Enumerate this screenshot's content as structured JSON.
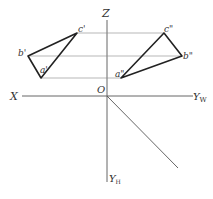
{
  "diagram": {
    "title": "",
    "axes": {
      "z_label": "Z",
      "x_label": "X",
      "origin_label": "O",
      "yw_label": "Y",
      "yw_sub": "W",
      "yh_label": "Y",
      "yh_sub": "H"
    },
    "front_view": {
      "a_label": "a'",
      "b_label": "b'",
      "c_label": "c'",
      "points": {
        "a": [
          41,
          78
        ],
        "b": [
          28,
          56
        ],
        "c": [
          77,
          33
        ]
      }
    },
    "side_view": {
      "a_label": "a\"",
      "b_label": "b\"",
      "c_label": "c\"",
      "points": {
        "a": [
          121,
          78
        ],
        "b": [
          182,
          56
        ],
        "c": [
          164,
          33
        ]
      }
    },
    "colors": {
      "line": "#333333",
      "thin_line": "#777777",
      "background": "#ffffff"
    }
  }
}
